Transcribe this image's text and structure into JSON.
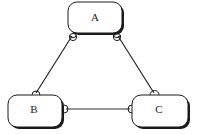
{
  "diagram": {
    "type": "entity-relationship",
    "colors": {
      "stroke": "#1a1a1a",
      "fill": "#ffffff",
      "text": "#222222"
    },
    "nodes": [
      {
        "id": "A",
        "label": "A",
        "x": 68,
        "y": 2,
        "w": 54,
        "h": 31
      },
      {
        "id": "B",
        "label": "B",
        "x": 8,
        "y": 95,
        "w": 54,
        "h": 32
      },
      {
        "id": "C",
        "label": "C",
        "x": 132,
        "y": 95,
        "w": 56,
        "h": 32
      }
    ],
    "edges": [
      {
        "from": "A",
        "to": "B",
        "from_end": "socket",
        "to_end": "socket"
      },
      {
        "from": "A",
        "to": "C",
        "from_end": "socket",
        "to_end": "socket"
      },
      {
        "from": "B",
        "to": "C",
        "from_end": "socket",
        "to_end": "socket"
      }
    ]
  }
}
